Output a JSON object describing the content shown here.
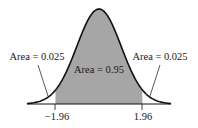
{
  "diagram": {
    "type": "normal-distribution",
    "labels": {
      "left_area": "Area = 0.025",
      "center_area": "Area = 0.95",
      "right_area": "Area = 0.025",
      "left_critical": "−1.96",
      "right_critical": "1.96"
    },
    "values": {
      "left_tail_area": 0.025,
      "center_area": 0.95,
      "right_tail_area": 0.025,
      "lower_critical_z": -1.96,
      "upper_critical_z": 1.96
    },
    "colors": {
      "shade": "#a6a6a6",
      "curve": "#111111",
      "text": "#1a1a1a",
      "background": "#ffffff"
    }
  }
}
